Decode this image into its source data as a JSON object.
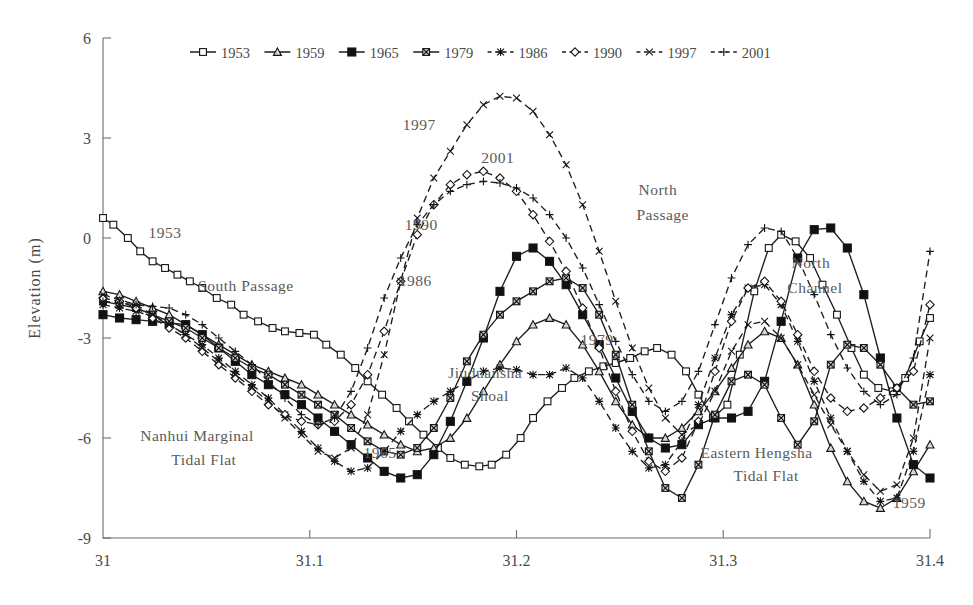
{
  "chart_data": {
    "type": "line",
    "title": "",
    "xlabel": "",
    "ylabel": "Elevation (m)",
    "xlim": [
      31.0,
      31.4
    ],
    "ylim": [
      -9,
      6
    ],
    "xticks": [
      "31",
      "31.1",
      "31.2",
      "31.3",
      "31.4"
    ],
    "xtick_values": [
      31,
      31.1,
      31.2,
      31.3,
      31.4
    ],
    "yticks": [
      "6",
      "3",
      "0",
      "-3",
      "-6",
      "-9"
    ],
    "ytick_values": [
      6,
      3,
      0,
      -3,
      -6,
      -9
    ],
    "grid": false,
    "legend_position": "top-center",
    "legend": [
      "1953",
      "1959",
      "1965",
      "1979",
      "1986",
      "1990",
      "1997",
      "2001"
    ],
    "series": [
      {
        "name": "1953",
        "marker": "open-square",
        "dash": "solid",
        "x": [
          31.0,
          31.005,
          31.012,
          31.018,
          31.024,
          31.03,
          31.036,
          31.042,
          31.048,
          31.055,
          31.062,
          31.068,
          31.075,
          31.082,
          31.088,
          31.095,
          31.102,
          31.108,
          31.115,
          31.122,
          31.128,
          31.135,
          31.142,
          31.148,
          31.155,
          31.162,
          31.168,
          31.175,
          31.182,
          31.188,
          31.195,
          31.202,
          31.208,
          31.215,
          31.222,
          31.228,
          31.235,
          31.242,
          31.248,
          31.255,
          31.262,
          31.268,
          31.275,
          31.282,
          31.288,
          31.295,
          31.302,
          31.308,
          31.315,
          31.322,
          31.328,
          31.335,
          31.342,
          31.348,
          31.355,
          31.362,
          31.368,
          31.375,
          31.382,
          31.388,
          31.395,
          31.4
        ],
        "y": [
          0.6,
          0.4,
          0.0,
          -0.4,
          -0.7,
          -0.9,
          -1.1,
          -1.3,
          -1.5,
          -1.8,
          -2.0,
          -2.3,
          -2.5,
          -2.7,
          -2.8,
          -2.85,
          -2.9,
          -3.2,
          -3.5,
          -3.9,
          -4.3,
          -4.7,
          -5.1,
          -5.5,
          -5.9,
          -6.3,
          -6.6,
          -6.8,
          -6.85,
          -6.8,
          -6.5,
          -6.0,
          -5.4,
          -4.9,
          -4.5,
          -4.2,
          -4.0,
          -3.85,
          -3.75,
          -3.6,
          -3.4,
          -3.3,
          -3.5,
          -4.0,
          -4.7,
          -5.4,
          -5.0,
          -3.5,
          -1.6,
          -0.3,
          0.1,
          -0.1,
          -0.6,
          -1.4,
          -2.3,
          -3.3,
          -4.1,
          -4.5,
          -4.6,
          -4.2,
          -3.1,
          -2.4
        ]
      },
      {
        "name": "1959",
        "marker": "triangle",
        "dash": "solid",
        "x": [
          31.0,
          31.008,
          31.016,
          31.024,
          31.032,
          31.04,
          31.048,
          31.056,
          31.064,
          31.072,
          31.08,
          31.088,
          31.096,
          31.104,
          31.112,
          31.12,
          31.128,
          31.136,
          31.144,
          31.152,
          31.16,
          31.168,
          31.176,
          31.184,
          31.192,
          31.2,
          31.208,
          31.216,
          31.224,
          31.232,
          31.24,
          31.248,
          31.256,
          31.264,
          31.272,
          31.28,
          31.288,
          31.296,
          31.304,
          31.312,
          31.32,
          31.328,
          31.336,
          31.344,
          31.352,
          31.36,
          31.368,
          31.376,
          31.384,
          31.392,
          31.4
        ],
        "y": [
          -1.6,
          -1.7,
          -1.9,
          -2.1,
          -2.3,
          -2.6,
          -2.9,
          -3.2,
          -3.5,
          -3.8,
          -4.0,
          -4.2,
          -4.4,
          -4.7,
          -5.0,
          -5.3,
          -5.6,
          -5.9,
          -6.2,
          -6.4,
          -6.3,
          -6.0,
          -5.4,
          -4.6,
          -3.8,
          -3.1,
          -2.6,
          -2.4,
          -2.6,
          -3.2,
          -4.0,
          -4.9,
          -5.6,
          -6.0,
          -6.0,
          -5.7,
          -5.2,
          -4.6,
          -3.9,
          -3.2,
          -2.8,
          -3.0,
          -3.8,
          -5.0,
          -6.3,
          -7.3,
          -7.9,
          -8.1,
          -7.8,
          -7.0,
          -6.2
        ]
      },
      {
        "name": "1965",
        "marker": "filled-square",
        "dash": "solid",
        "x": [
          31.0,
          31.008,
          31.016,
          31.024,
          31.032,
          31.04,
          31.048,
          31.056,
          31.064,
          31.072,
          31.08,
          31.088,
          31.096,
          31.104,
          31.112,
          31.12,
          31.128,
          31.136,
          31.144,
          31.152,
          31.16,
          31.168,
          31.176,
          31.184,
          31.192,
          31.2,
          31.208,
          31.216,
          31.224,
          31.232,
          31.24,
          31.248,
          31.256,
          31.264,
          31.272,
          31.28,
          31.288,
          31.296,
          31.304,
          31.312,
          31.32,
          31.328,
          31.336,
          31.344,
          31.352,
          31.36,
          31.368,
          31.376,
          31.384,
          31.392,
          31.4
        ],
        "y": [
          -2.3,
          -2.4,
          -2.45,
          -2.5,
          -2.55,
          -2.6,
          -2.9,
          -3.3,
          -3.7,
          -4.1,
          -4.4,
          -4.7,
          -5.0,
          -5.4,
          -5.8,
          -6.2,
          -6.6,
          -7.0,
          -7.2,
          -7.1,
          -6.5,
          -5.5,
          -4.3,
          -3.0,
          -1.6,
          -0.55,
          -0.3,
          -0.7,
          -1.4,
          -2.3,
          -3.2,
          -4.2,
          -5.2,
          -6.0,
          -6.3,
          -6.2,
          -5.6,
          -5.4,
          -5.4,
          -5.2,
          -4.3,
          -2.5,
          -0.6,
          0.25,
          0.3,
          -0.3,
          -1.7,
          -3.6,
          -5.4,
          -6.8,
          -7.2
        ]
      },
      {
        "name": "1979",
        "marker": "crossed-square",
        "dash": "solid",
        "x": [
          31.0,
          31.008,
          31.016,
          31.024,
          31.032,
          31.04,
          31.048,
          31.056,
          31.064,
          31.072,
          31.08,
          31.088,
          31.096,
          31.104,
          31.112,
          31.12,
          31.128,
          31.136,
          31.144,
          31.152,
          31.16,
          31.168,
          31.176,
          31.184,
          31.192,
          31.2,
          31.208,
          31.216,
          31.224,
          31.232,
          31.24,
          31.248,
          31.256,
          31.264,
          31.272,
          31.28,
          31.288,
          31.296,
          31.304,
          31.312,
          31.32,
          31.328,
          31.336,
          31.344,
          31.352,
          31.36,
          31.368,
          31.376,
          31.384,
          31.392,
          31.4
        ],
        "y": [
          -1.9,
          -2.0,
          -2.1,
          -2.3,
          -2.5,
          -2.7,
          -3.0,
          -3.3,
          -3.6,
          -3.9,
          -4.1,
          -4.4,
          -4.7,
          -5.0,
          -5.3,
          -5.7,
          -6.1,
          -6.4,
          -6.5,
          -6.3,
          -5.7,
          -4.8,
          -3.7,
          -2.9,
          -2.3,
          -1.9,
          -1.6,
          -1.3,
          -1.2,
          -1.5,
          -2.3,
          -3.5,
          -5.0,
          -6.4,
          -7.5,
          -7.8,
          -6.8,
          -5.3,
          -4.3,
          -4.1,
          -4.4,
          -5.4,
          -6.2,
          -5.5,
          -3.8,
          -3.2,
          -3.3,
          -3.8,
          -4.5,
          -5.0,
          -4.9
        ]
      },
      {
        "name": "1986",
        "marker": "asterisk",
        "dash": "dashed",
        "x": [
          31.0,
          31.008,
          31.016,
          31.024,
          31.032,
          31.04,
          31.048,
          31.056,
          31.064,
          31.072,
          31.08,
          31.088,
          31.096,
          31.104,
          31.112,
          31.12,
          31.128,
          31.136,
          31.144,
          31.152,
          31.16,
          31.168,
          31.176,
          31.184,
          31.192,
          31.2,
          31.208,
          31.216,
          31.224,
          31.232,
          31.24,
          31.248,
          31.256,
          31.264,
          31.272,
          31.28,
          31.288,
          31.296,
          31.304,
          31.312,
          31.32,
          31.328,
          31.336,
          31.344,
          31.352,
          31.36,
          31.368,
          31.376,
          31.384,
          31.392,
          31.4
        ],
        "y": [
          -2.0,
          -2.1,
          -2.2,
          -2.35,
          -2.6,
          -2.9,
          -3.2,
          -3.6,
          -4.0,
          -4.4,
          -4.8,
          -5.3,
          -5.8,
          -6.3,
          -6.7,
          -7.0,
          -6.9,
          -6.4,
          -5.8,
          -5.3,
          -4.9,
          -4.6,
          -4.3,
          -4.0,
          -3.9,
          -3.95,
          -4.1,
          -4.1,
          -3.9,
          -4.2,
          -4.9,
          -5.7,
          -6.4,
          -6.9,
          -6.8,
          -6.1,
          -5.0,
          -3.6,
          -2.3,
          -1.5,
          -1.4,
          -2.0,
          -3.1,
          -4.3,
          -5.4,
          -6.4,
          -7.3,
          -7.9,
          -7.8,
          -6.4,
          -4.1
        ]
      },
      {
        "name": "1990",
        "marker": "open-diamond",
        "dash": "dashed",
        "x": [
          31.0,
          31.008,
          31.016,
          31.024,
          31.032,
          31.04,
          31.048,
          31.056,
          31.064,
          31.072,
          31.08,
          31.088,
          31.096,
          31.104,
          31.112,
          31.12,
          31.128,
          31.136,
          31.144,
          31.152,
          31.16,
          31.168,
          31.176,
          31.184,
          31.192,
          31.2,
          31.208,
          31.216,
          31.224,
          31.232,
          31.24,
          31.248,
          31.256,
          31.264,
          31.272,
          31.28,
          31.288,
          31.296,
          31.304,
          31.312,
          31.32,
          31.328,
          31.336,
          31.344,
          31.352,
          31.36,
          31.368,
          31.376,
          31.384,
          31.392,
          31.4
        ],
        "y": [
          -1.8,
          -1.9,
          -2.1,
          -2.4,
          -2.7,
          -3.0,
          -3.4,
          -3.8,
          -4.2,
          -4.6,
          -5.0,
          -5.3,
          -5.5,
          -5.6,
          -5.5,
          -5.0,
          -4.1,
          -2.8,
          -1.3,
          0.1,
          1.0,
          1.6,
          1.9,
          2.0,
          1.8,
          1.4,
          0.7,
          -0.1,
          -1.0,
          -2.1,
          -3.3,
          -4.6,
          -5.8,
          -6.7,
          -7.0,
          -6.6,
          -5.5,
          -4.0,
          -2.5,
          -1.5,
          -1.3,
          -1.9,
          -2.9,
          -4.0,
          -4.8,
          -5.2,
          -5.1,
          -4.8,
          -4.5,
          -4.0,
          -2.0
        ]
      },
      {
        "name": "1997",
        "marker": "x-cross",
        "dash": "dashed",
        "x": [
          31.0,
          31.008,
          31.016,
          31.024,
          31.032,
          31.04,
          31.048,
          31.056,
          31.064,
          31.072,
          31.08,
          31.088,
          31.096,
          31.104,
          31.112,
          31.12,
          31.128,
          31.136,
          31.144,
          31.152,
          31.16,
          31.168,
          31.176,
          31.184,
          31.192,
          31.2,
          31.208,
          31.216,
          31.224,
          31.232,
          31.24,
          31.248,
          31.256,
          31.264,
          31.272,
          31.28,
          31.288,
          31.296,
          31.304,
          31.312,
          31.32,
          31.328,
          31.336,
          31.344,
          31.352,
          31.36,
          31.368,
          31.376,
          31.384,
          31.392,
          31.4
        ],
        "y": [
          -1.7,
          -1.85,
          -2.0,
          -2.3,
          -2.6,
          -2.9,
          -3.3,
          -3.7,
          -4.1,
          -4.5,
          -4.9,
          -5.4,
          -5.9,
          -6.4,
          -6.6,
          -6.3,
          -5.3,
          -3.5,
          -1.3,
          0.6,
          1.8,
          2.6,
          3.4,
          4.0,
          4.25,
          4.2,
          3.8,
          3.1,
          2.2,
          1.0,
          -0.4,
          -1.9,
          -3.3,
          -4.5,
          -5.4,
          -5.9,
          -5.6,
          -4.6,
          -3.4,
          -2.6,
          -2.5,
          -3.0,
          -3.8,
          -4.7,
          -5.6,
          -6.4,
          -7.1,
          -7.6,
          -7.4,
          -6.0,
          -3.0
        ]
      },
      {
        "name": "2001",
        "marker": "plus",
        "dash": "dashed",
        "x": [
          31.0,
          31.008,
          31.016,
          31.024,
          31.032,
          31.04,
          31.048,
          31.056,
          31.064,
          31.072,
          31.08,
          31.088,
          31.096,
          31.104,
          31.112,
          31.12,
          31.128,
          31.136,
          31.144,
          31.152,
          31.16,
          31.168,
          31.176,
          31.184,
          31.192,
          31.2,
          31.208,
          31.216,
          31.224,
          31.232,
          31.24,
          31.248,
          31.256,
          31.264,
          31.272,
          31.28,
          31.288,
          31.296,
          31.304,
          31.312,
          31.32,
          31.328,
          31.336,
          31.344,
          31.352,
          31.36,
          31.368,
          31.376,
          31.384,
          31.392,
          31.4
        ],
        "y": [
          -1.9,
          -1.95,
          -2.0,
          -2.05,
          -2.1,
          -2.3,
          -2.6,
          -3.0,
          -3.4,
          -3.8,
          -4.3,
          -4.8,
          -5.3,
          -5.6,
          -5.4,
          -4.6,
          -3.3,
          -1.8,
          -0.6,
          0.4,
          1.0,
          1.4,
          1.6,
          1.7,
          1.65,
          1.5,
          1.2,
          0.7,
          0.0,
          -0.9,
          -2.0,
          -3.1,
          -4.1,
          -4.9,
          -5.2,
          -4.9,
          -4.0,
          -2.6,
          -1.2,
          -0.2,
          0.3,
          0.2,
          -0.6,
          -1.7,
          -2.9,
          -3.9,
          -4.6,
          -5.0,
          -4.7,
          -3.6,
          -0.4
        ]
      }
    ],
    "annotations": [
      {
        "text": "1953",
        "x": 31.022,
        "y": 0.0
      },
      {
        "text": "South Passage",
        "x": 31.046,
        "y": -1.6
      },
      {
        "text": "Nanhui Marginal",
        "x": 31.018,
        "y": -6.1
      },
      {
        "text": "Tidal Flat",
        "x": 31.033,
        "y": -6.8
      },
      {
        "text": "1965",
        "x": 31.126,
        "y": -6.6
      },
      {
        "text": "Jiuduansha",
        "x": 31.167,
        "y": -4.2
      },
      {
        "text": "Shoal",
        "x": 31.178,
        "y": -4.9
      },
      {
        "text": "1986",
        "x": 31.143,
        "y": -1.45
      },
      {
        "text": "1990",
        "x": 31.146,
        "y": 0.25
      },
      {
        "text": "1997",
        "x": 31.145,
        "y": 3.25
      },
      {
        "text": "2001",
        "x": 31.183,
        "y": 2.25
      },
      {
        "text": "North",
        "x": 31.259,
        "y": 1.3
      },
      {
        "text": "Passage",
        "x": 31.258,
        "y": 0.55
      },
      {
        "text": "1979",
        "x": 31.231,
        "y": -3.2
      },
      {
        "text": "Eastern Hengsha",
        "x": 31.289,
        "y": -6.6
      },
      {
        "text": "Tidal Flat",
        "x": 31.305,
        "y": -7.3
      },
      {
        "text": "North",
        "x": 31.333,
        "y": -0.9
      },
      {
        "text": "Channel",
        "x": 31.331,
        "y": -1.65
      },
      {
        "text": "1959",
        "x": 31.382,
        "y": -8.1
      }
    ]
  },
  "colors": {
    "line": "#1d1d1d",
    "axis": "#6e6e6e",
    "text": "#4a4a4a",
    "annotation": "#5a5a5a",
    "background": "#ffffff"
  }
}
